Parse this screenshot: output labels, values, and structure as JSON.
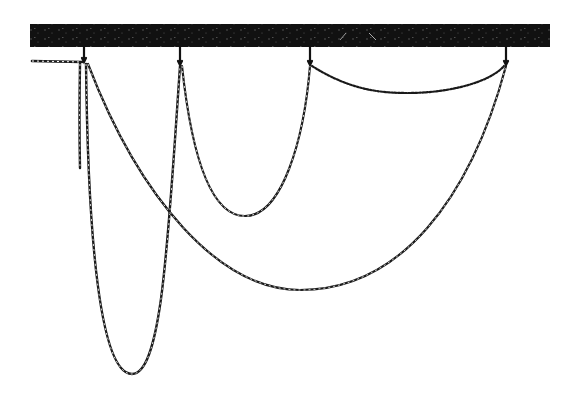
{
  "figure": {
    "colors": {
      "ink": "#1a1a1a",
      "beam": "#111111",
      "background": "#ffffff"
    },
    "beam": {
      "x": 30,
      "y": 24,
      "width": 520,
      "height": 23
    },
    "hooks": [
      {
        "id": "hook-1",
        "x": 84,
        "y": 60
      },
      {
        "id": "hook-2",
        "x": 180,
        "y": 63
      },
      {
        "id": "hook-3",
        "x": 310,
        "y": 63
      },
      {
        "id": "hook-4",
        "x": 506,
        "y": 63
      }
    ],
    "chains": [
      {
        "id": "loose-end-left",
        "from": "beam-edge",
        "to": "hook-1",
        "lowest_y": 62
      },
      {
        "id": "dangling-end",
        "from": "hook-1",
        "free_end_y": 168
      },
      {
        "id": "deep-loop",
        "from": "hook-1",
        "to": "hook-2",
        "lowest_point": [
          132,
          374
        ]
      },
      {
        "id": "medium-loop",
        "from": "hook-2",
        "to": "hook-3",
        "lowest_point": [
          245,
          216
        ]
      },
      {
        "id": "long-span",
        "from": "hook-1",
        "to": "hook-4",
        "lowest_point": [
          300,
          290
        ]
      },
      {
        "id": "shallow-span",
        "from": "hook-3",
        "to": "hook-4",
        "lowest_point": [
          408,
          93
        ]
      }
    ]
  }
}
